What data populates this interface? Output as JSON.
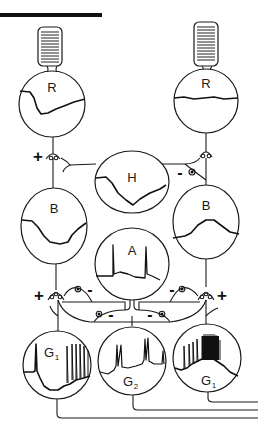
{
  "diagram": {
    "title_bar": {
      "color": "#111111"
    },
    "colors": {
      "ink": "#1a1a1a",
      "background": "#ffffff"
    },
    "cells": {
      "receptor_left": {
        "label": "R",
        "type": "rod photoreceptor",
        "response": "hyperpolarizing"
      },
      "receptor_right": {
        "label": "R",
        "type": "rod photoreceptor",
        "response": "flat/depolarizing"
      },
      "horizontal": {
        "label": "H",
        "type": "horizontal cell",
        "response": "hyperpolarizing"
      },
      "bipolar_left": {
        "label": "B",
        "type": "bipolar cell",
        "response": "hyperpolarizing"
      },
      "bipolar_right": {
        "label": "B",
        "type": "bipolar cell",
        "response": "depolarizing"
      },
      "amacrine": {
        "label": "A",
        "type": "amacrine cell",
        "response": "transient spikes at on/off"
      },
      "ganglion_left": {
        "label": "G",
        "subscript": "1",
        "type": "ganglion cell",
        "response": "off-center, burst at light off"
      },
      "ganglion_center": {
        "label": "G",
        "subscript": "2",
        "type": "ganglion cell",
        "response": "on-off transient spikes"
      },
      "ganglion_right": {
        "label": "G",
        "subscript": "1",
        "type": "ganglion cell",
        "response": "on-center, burst during light"
      }
    },
    "synapses": {
      "r_left_to_b_left": "+",
      "h_to_b_right": "-",
      "b_left_to_g_left": "+",
      "a_to_g_left": "-",
      "a_to_g_right": "-",
      "b_right_to_g_right": "+",
      "a_to_b_left_terminal": "-",
      "a_to_b_right_terminal": "-"
    }
  }
}
